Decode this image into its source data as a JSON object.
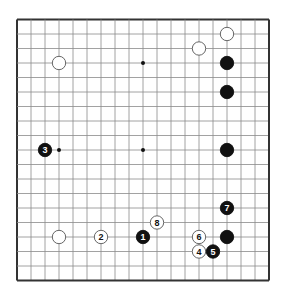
{
  "diagram": {
    "type": "go-board",
    "size": 19,
    "colors": {
      "line": "#8a8a8a",
      "border": "#333333",
      "black": "#111111",
      "white": "#ffffff",
      "background": "#ffffff"
    },
    "hoshi": [
      [
        3,
        3
      ],
      [
        9,
        3
      ],
      [
        15,
        3
      ],
      [
        3,
        9
      ],
      [
        9,
        9
      ],
      [
        15,
        9
      ],
      [
        3,
        15
      ],
      [
        9,
        15
      ],
      [
        15,
        15
      ]
    ],
    "stones": [
      {
        "color": "white",
        "col": 3,
        "row": 3,
        "label": ""
      },
      {
        "color": "white",
        "col": 13,
        "row": 2,
        "label": ""
      },
      {
        "color": "white",
        "col": 15,
        "row": 1,
        "label": ""
      },
      {
        "color": "black",
        "col": 15,
        "row": 3,
        "label": ""
      },
      {
        "color": "black",
        "col": 15,
        "row": 5,
        "label": ""
      },
      {
        "color": "black",
        "col": 15,
        "row": 9,
        "label": ""
      },
      {
        "color": "black",
        "col": 2,
        "row": 9,
        "label": "3"
      },
      {
        "color": "black",
        "col": 15,
        "row": 13,
        "label": "7"
      },
      {
        "color": "white",
        "col": 10,
        "row": 14,
        "label": "8"
      },
      {
        "color": "black",
        "col": 9,
        "row": 15,
        "label": "1"
      },
      {
        "color": "white",
        "col": 6,
        "row": 15,
        "label": "2"
      },
      {
        "color": "white",
        "col": 3,
        "row": 15,
        "label": ""
      },
      {
        "color": "white",
        "col": 13,
        "row": 15,
        "label": "6"
      },
      {
        "color": "black",
        "col": 15,
        "row": 15,
        "label": ""
      },
      {
        "color": "white",
        "col": 13,
        "row": 16,
        "label": "4"
      },
      {
        "color": "black",
        "col": 14,
        "row": 16,
        "label": "5"
      }
    ]
  }
}
